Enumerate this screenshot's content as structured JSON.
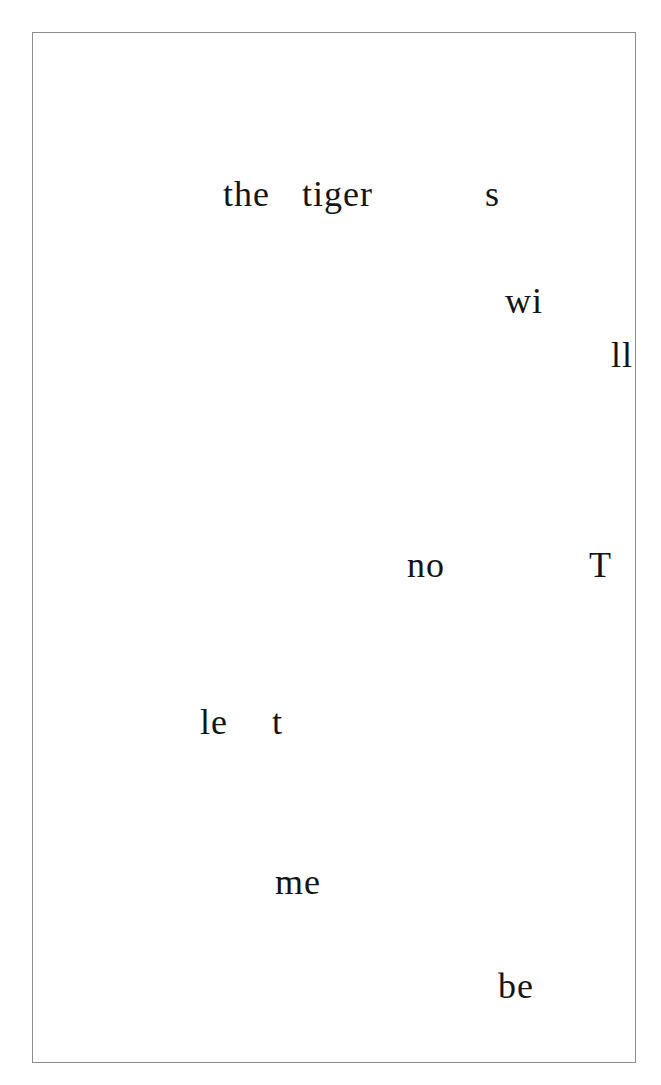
{
  "page": {
    "border_color": "#8c8c8c",
    "text_color": "#141414",
    "fragments": [
      {
        "text": "the",
        "x": 223,
        "baseline": 205
      },
      {
        "text": "tiger",
        "x": 302,
        "baseline": 205
      },
      {
        "text": "s",
        "x": 485,
        "baseline": 205
      },
      {
        "text": "wi",
        "x": 505,
        "baseline": 312
      },
      {
        "text": "ll",
        "x": 611,
        "baseline": 366
      },
      {
        "text": "no",
        "x": 407,
        "baseline": 576
      },
      {
        "text": "T",
        "x": 589,
        "baseline": 576
      },
      {
        "text": "le",
        "x": 200,
        "baseline": 733
      },
      {
        "text": "t",
        "x": 272,
        "baseline": 733
      },
      {
        "text": "me",
        "x": 275,
        "baseline": 893
      },
      {
        "text": "be",
        "x": 498,
        "baseline": 997
      }
    ]
  }
}
